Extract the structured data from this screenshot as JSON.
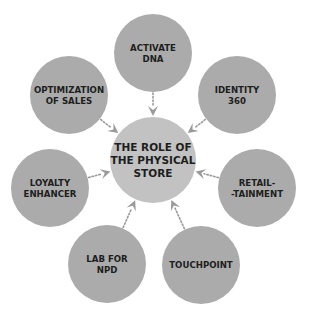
{
  "colors": {
    "outer_node": "#ababab",
    "center_node": "#c2c2c2",
    "arrow": "#9a9a9a",
    "text": "#1e1e1e",
    "background": "#ffffff"
  },
  "center": {
    "id": "role-of-physical-store",
    "lines": [
      "THE ROLE OF",
      "THE PHYSICAL",
      "STORE"
    ]
  },
  "nodes": [
    {
      "id": "activate-dna",
      "lines": [
        "ACTIVATE",
        "DNA"
      ],
      "position": "top"
    },
    {
      "id": "identity-360",
      "lines": [
        "IDENTITY",
        "360"
      ],
      "position": "upper-right"
    },
    {
      "id": "retail-tainment",
      "lines": [
        "RETAIL-",
        "-TAINMENT"
      ],
      "position": "lower-right"
    },
    {
      "id": "touchpoint",
      "lines": [
        "TOUCHPOINT"
      ],
      "position": "bottom-right"
    },
    {
      "id": "lab-for-npd",
      "lines": [
        "LAB FOR",
        "NPD"
      ],
      "position": "bottom-left"
    },
    {
      "id": "loyalty-enhancer",
      "lines": [
        "LOYALTY",
        "ENHANCER"
      ],
      "position": "lower-left"
    },
    {
      "id": "optimization-of-sales",
      "lines": [
        "OPTIMIZATION",
        "OF SALES"
      ],
      "position": "upper-left"
    }
  ],
  "edges": [
    {
      "from": "activate-dna",
      "to": "role-of-physical-store",
      "style": "dotted-arrow"
    },
    {
      "from": "identity-360",
      "to": "role-of-physical-store",
      "style": "dotted-arrow"
    },
    {
      "from": "retail-tainment",
      "to": "role-of-physical-store",
      "style": "dotted-arrow"
    },
    {
      "from": "touchpoint",
      "to": "role-of-physical-store",
      "style": "dotted-arrow"
    },
    {
      "from": "lab-for-npd",
      "to": "role-of-physical-store",
      "style": "dotted-arrow"
    },
    {
      "from": "loyalty-enhancer",
      "to": "role-of-physical-store",
      "style": "dotted-arrow"
    },
    {
      "from": "optimization-of-sales",
      "to": "role-of-physical-store",
      "style": "dotted-arrow"
    }
  ]
}
